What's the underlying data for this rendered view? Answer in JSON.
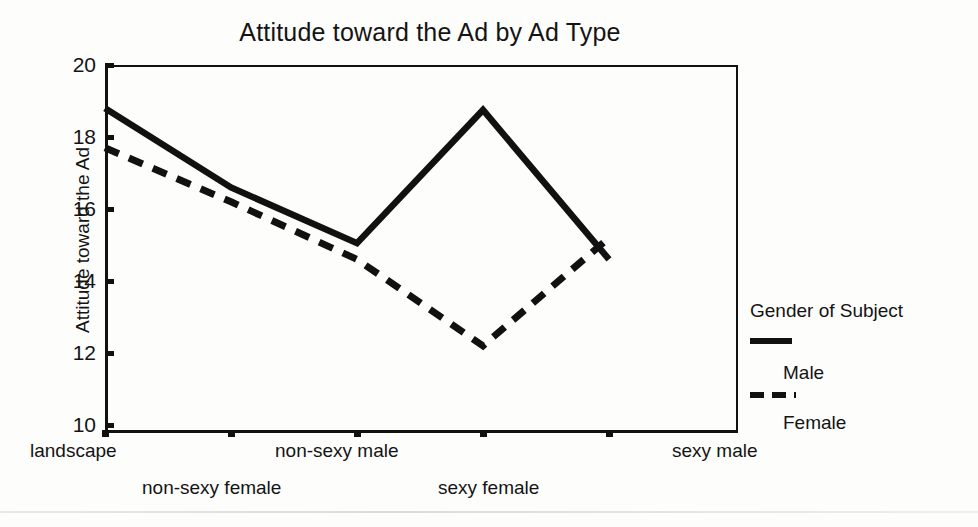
{
  "chart_data": {
    "type": "line",
    "title": "Attitude toward the Ad by Ad Type",
    "xlabel": "",
    "ylabel": "Attitude toward the Ad",
    "categories": [
      "landscape",
      "non-sexy female",
      "non-sexy male",
      "sexy female",
      "sexy male"
    ],
    "series": [
      {
        "name": "Male",
        "style": "solid",
        "color": "#111111",
        "values": [
          18.8,
          16.6,
          15.05,
          18.75,
          14.6
        ]
      },
      {
        "name": "Female",
        "style": "dashed",
        "color": "#111111",
        "values": [
          17.7,
          16.2,
          14.6,
          12.2,
          15.2
        ]
      }
    ],
    "ylim": [
      10,
      20
    ],
    "yticks": [
      20,
      18,
      16,
      14,
      12,
      10
    ],
    "ytick_labels": [
      "20",
      "18",
      "16",
      "14",
      "12",
      "10"
    ],
    "grid": false,
    "legend_position": "right",
    "legend_title": "Gender of Subject"
  },
  "axis": {
    "y_title": "Attitude toward the Ad",
    "tick_labels_y": [
      "20",
      "18",
      "16",
      "14",
      "12",
      "10"
    ],
    "tick_labels_x": [
      "landscape",
      "non-sexy female",
      "non-sexy male",
      "sexy female",
      "sexy male"
    ]
  },
  "legend": {
    "title": "Gender of Subject",
    "entries": [
      {
        "label": "Male",
        "style": "solid"
      },
      {
        "label": "Female",
        "style": "dashed"
      }
    ]
  }
}
